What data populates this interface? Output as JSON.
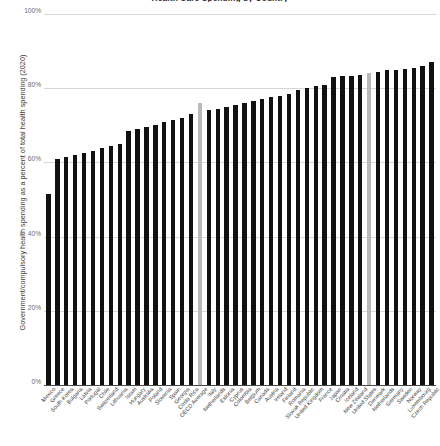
{
  "chart_data": {
    "type": "bar",
    "title": "Health Care Spending by Country",
    "xlabel": "",
    "ylabel": "Government/compulsory health spending as a percent of total health spending (2020)",
    "ylim": [
      0,
      100
    ],
    "grid": true,
    "legend": "none",
    "y_tick_labels": [
      "100%",
      "80%",
      "60%",
      "40%",
      "20%",
      "0%"
    ],
    "y_tick_values": [
      100,
      80,
      60,
      40,
      20,
      0
    ],
    "colors": {
      "bar": "#111111",
      "highlight": "#b9b9b9",
      "gridline": "#d8d8d8",
      "axis": "#4a4a4a",
      "text": "#3a3a3a"
    },
    "highlighted_categories": [
      "OECD Average",
      "United States"
    ],
    "categories": [
      "Mexico",
      "Greece",
      "South Korea",
      "Bulgaria",
      "Latvia",
      "Portugal",
      "Chile",
      "Switzerland",
      "Lithuania",
      "Israel",
      "Hungary",
      "Australia",
      "Poland",
      "Slovenia",
      "Spain",
      "Georgia",
      "Costa Rica",
      "OECD Average",
      "Italy",
      "Netherlands",
      "Estonia",
      "Cyprus",
      "Colombia",
      "Belgium",
      "Canada",
      "Austria",
      "Ireland",
      "Finland",
      "Romania",
      "Slovak Republic",
      "United Kingdom",
      "France",
      "Japan",
      "Croatia",
      "Iceland",
      "New Zealand",
      "United States",
      "Denmark",
      "Netherlands",
      "Germany",
      "Sweden",
      "Norway",
      "Luxembourg",
      "Czech Republic"
    ],
    "values": [
      51.5,
      61.0,
      61.5,
      62.0,
      62.5,
      63.0,
      64.0,
      64.5,
      65.0,
      68.5,
      69.0,
      69.5,
      70.0,
      71.0,
      71.5,
      72.0,
      73.0,
      76.0,
      74.0,
      74.5,
      75.0,
      75.5,
      76.0,
      76.5,
      77.0,
      77.5,
      78.0,
      78.5,
      79.5,
      80.0,
      80.5,
      81.0,
      83.0,
      83.2,
      83.4,
      83.6,
      84.0,
      84.5,
      84.8,
      85.0,
      85.2,
      85.5,
      86.0,
      87.0
    ]
  }
}
